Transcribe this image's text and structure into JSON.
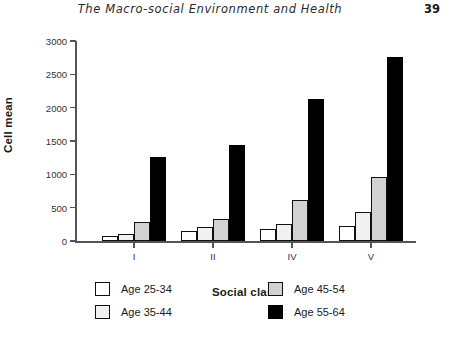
{
  "runhead": {
    "title": "The Macro-social Environment and Health",
    "page_number": "39"
  },
  "chart_data": {
    "type": "bar",
    "title": "",
    "xlabel": "Social class",
    "ylabel": "Cell mean",
    "categories": [
      "I",
      "II",
      "IV",
      "V"
    ],
    "ylim": [
      0,
      3000
    ],
    "yticks": [
      0,
      500,
      1000,
      1500,
      2000,
      2500,
      3000
    ],
    "ytick_labels": [
      "0",
      "500",
      "1000",
      "1500",
      "2000",
      "2500",
      "3000"
    ],
    "grid": false,
    "legend_position": "bottom",
    "series": [
      {
        "name": "Age 25-34",
        "color": "#ffffff",
        "values": [
          70,
          150,
          180,
          225
        ]
      },
      {
        "name": "Age 35-44",
        "color": "#f1f1f1",
        "values": [
          110,
          210,
          255,
          435
        ]
      },
      {
        "name": "Age 45-54",
        "color": "#d2d2d2",
        "values": [
          280,
          330,
          610,
          960
        ]
      },
      {
        "name": "Age 55-64",
        "color": "#000000",
        "values": [
          1260,
          1440,
          2130,
          2760
        ]
      }
    ]
  }
}
